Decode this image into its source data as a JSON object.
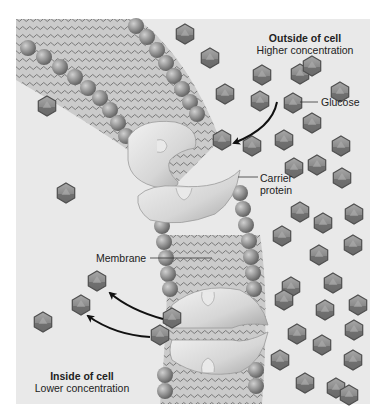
{
  "diagram": {
    "background_color": "#e8e8e8",
    "outside_region": {
      "title": "Outside of cell",
      "subtitle": "Higher concentration"
    },
    "inside_region": {
      "title": "Inside of cell",
      "subtitle": "Lower concentration"
    },
    "labels": {
      "glucose": "Glucose",
      "carrier_protein_line1": "Carrier",
      "carrier_protein_line2": "protein",
      "membrane": "Membrane"
    },
    "colors": {
      "background": "#e8e8e8",
      "membrane_fill": "#c9c9c9",
      "phospholipid_head": "#8f8f8f",
      "tail": "#6a6a6a",
      "protein": "#d9d9d9",
      "glucose_fill": "#8a8a8a",
      "glucose_stroke": "#555555",
      "arrow": "#111111",
      "text": "#222222"
    },
    "glucose_count": {
      "outside": 36,
      "inside": 6
    }
  }
}
